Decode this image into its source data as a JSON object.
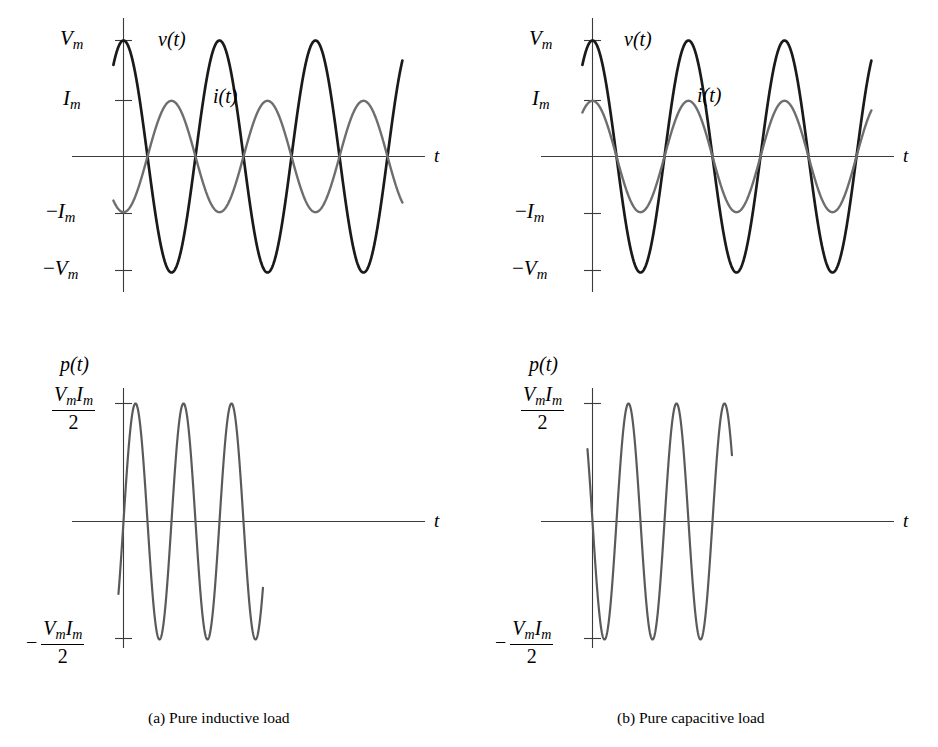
{
  "figure": {
    "title_hidden": "",
    "captions": [
      {
        "id": "a",
        "text": "(a) Pure inductive load"
      },
      {
        "id": "b",
        "text": "(b) Pure capacitive load"
      }
    ]
  },
  "axis_labels": {
    "t": "t",
    "v_of_t": "v(t)",
    "i_of_t": "i(t)",
    "p_of_t": "p(t)",
    "Vm": "V",
    "Vm_sub": "m",
    "Im": "I",
    "Im_sub": "m",
    "neg_Vm_prefix": "−",
    "neg_Im_prefix": "−",
    "frac_num_V": "V",
    "frac_num_I": "I",
    "frac_den": "2",
    "minus": "−"
  },
  "colors": {
    "voltage": "#1a1a1a",
    "current": "#6e6e6e",
    "power": "#5a5a5a",
    "axis": "#3b3b3b",
    "background": "#ffffff",
    "text": "#000000"
  },
  "chart_data": [
    {
      "id": "inductive-voltage-current",
      "type": "line",
      "title": "Pure inductive load: voltage and current",
      "xlabel": "t",
      "ylabel": "",
      "xlim": [
        -0.12,
        3.15
      ],
      "ylim": [
        -1.22,
        1.22
      ],
      "grid": false,
      "legend": "inline-annotations",
      "ytick_labels": [
        "V_m",
        "I_m",
        "0",
        "-I_m",
        "-V_m"
      ],
      "ytick_values": [
        1.0,
        0.48,
        0.0,
        -0.48,
        -1.0
      ],
      "annotations": [
        {
          "text": "v(t)",
          "x": 0.16,
          "y": 0.88
        },
        {
          "text": "i(t)",
          "x": 0.4,
          "y": 0.5
        },
        {
          "text": "t",
          "x": 3.12,
          "y": 0.0
        }
      ],
      "series": [
        {
          "name": "v(t)",
          "color": "#1a1a1a",
          "amplitude": 1.0,
          "form": "cos",
          "phase_deg": 0,
          "cycles": 3,
          "x_start": -0.105,
          "x_end": 2.905,
          "linewidth": 2.6
        },
        {
          "name": "i(t)",
          "color": "#6e6e6e",
          "amplitude": 0.48,
          "form": "sin",
          "phase_deg": -90,
          "cycles": 3,
          "x_start": -0.105,
          "x_end": 2.905,
          "linewidth": 2.3
        }
      ]
    },
    {
      "id": "capacitive-voltage-current",
      "type": "line",
      "title": "Pure capacitive load: voltage and current",
      "xlabel": "t",
      "ylabel": "",
      "xlim": [
        -0.12,
        3.15
      ],
      "ylim": [
        -1.22,
        1.22
      ],
      "grid": false,
      "legend": "inline-annotations",
      "ytick_labels": [
        "V_m",
        "I_m",
        "0",
        "-I_m",
        "-V_m"
      ],
      "ytick_values": [
        1.0,
        0.48,
        0.0,
        -0.48,
        -1.0
      ],
      "annotations": [
        {
          "text": "v(t)",
          "x": 0.16,
          "y": 0.88
        },
        {
          "text": "i(t)",
          "x": 0.52,
          "y": 0.52
        },
        {
          "text": "t",
          "x": 3.12,
          "y": 0.0
        }
      ],
      "series": [
        {
          "name": "v(t)",
          "color": "#1a1a1a",
          "amplitude": 1.0,
          "form": "cos",
          "phase_deg": 0,
          "cycles": 3,
          "x_start": -0.105,
          "x_end": 2.905,
          "linewidth": 2.6
        },
        {
          "name": "i(t)",
          "color": "#6e6e6e",
          "amplitude": 0.48,
          "form": "sin",
          "phase_deg": 90,
          "cycles": 3,
          "x_start": -0.105,
          "x_end": 2.905,
          "linewidth": 2.3
        }
      ]
    },
    {
      "id": "inductive-power",
      "type": "line",
      "title": "Pure inductive load: instantaneous power",
      "xlabel": "t",
      "ylabel": "p(t)",
      "xlim": [
        -0.12,
        3.15
      ],
      "ylim": [
        -1.28,
        1.28
      ],
      "grid": false,
      "legend": "none",
      "ytick_labels": [
        "VmIm/2",
        "0",
        "-VmIm/2"
      ],
      "ytick_values": [
        1.0,
        0.0,
        -1.0
      ],
      "annotations": [
        {
          "text": "p(t)",
          "x": -0.05,
          "y": 1.22
        },
        {
          "text": "t",
          "x": 3.12,
          "y": 0.0
        }
      ],
      "series": [
        {
          "name": "p(t)",
          "color": "#5a5a5a",
          "amplitude": 1.0,
          "form": "sin",
          "phase_deg": 0,
          "cycles": 6,
          "x_start": -0.105,
          "x_end": 2.905,
          "linewidth": 2.1
        }
      ]
    },
    {
      "id": "capacitive-power",
      "type": "line",
      "title": "Pure capacitive load: instantaneous power",
      "xlabel": "t",
      "ylabel": "p(t)",
      "xlim": [
        -0.12,
        3.15
      ],
      "ylim": [
        -1.28,
        1.28
      ],
      "grid": false,
      "legend": "none",
      "ytick_labels": [
        "VmIm/2",
        "0",
        "-VmIm/2"
      ],
      "ytick_values": [
        1.0,
        0.0,
        -1.0
      ],
      "annotations": [
        {
          "text": "p(t)",
          "x": -0.05,
          "y": 1.22
        },
        {
          "text": "t",
          "x": 3.12,
          "y": 0.0
        }
      ],
      "series": [
        {
          "name": "p(t)",
          "color": "#5a5a5a",
          "amplitude": -1.0,
          "form": "sin",
          "phase_deg": 0,
          "cycles": 6,
          "x_start": -0.105,
          "x_end": 2.905,
          "linewidth": 2.1
        }
      ]
    }
  ]
}
